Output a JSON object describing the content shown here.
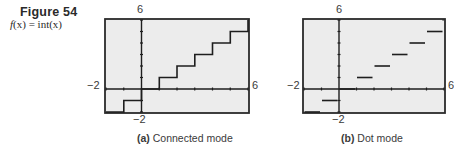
{
  "figure": {
    "label": "Figure 54",
    "function": "f(x) = int(x)",
    "function_prefix": "f",
    "function_rest": "(x)  =  int(x)"
  },
  "panels": [
    {
      "id": "a",
      "caption_tag": "(a)",
      "caption_text": "Connected mode",
      "ymax_label": "6",
      "ymin_label": "−2",
      "xmin_label": "−2",
      "xmax_label": "6"
    },
    {
      "id": "b",
      "caption_tag": "(b)",
      "caption_text": "Dot mode",
      "ymax_label": "6",
      "ymin_label": "−2",
      "xmin_label": "−2",
      "xmax_label": "6"
    }
  ],
  "colors": {
    "screen_bg": "#ececec",
    "frame": "#2b2b2b",
    "curve": "#1e1e1e"
  },
  "chart_data": [
    {
      "type": "line",
      "title": "(a) Connected mode",
      "function": "int(x)",
      "xlim": [
        -2,
        6
      ],
      "ylim": [
        -2,
        6
      ],
      "xscale": 1,
      "yscale": 1,
      "grid": false,
      "mode": "connected",
      "x": [
        -2,
        -1,
        -1,
        0,
        0,
        1,
        1,
        2,
        2,
        3,
        3,
        4,
        4,
        5,
        5,
        6,
        6
      ],
      "y": [
        -2,
        -2,
        -1,
        -1,
        0,
        0,
        1,
        1,
        2,
        2,
        3,
        3,
        4,
        4,
        5,
        5,
        6
      ]
    },
    {
      "type": "line",
      "title": "(b) Dot mode",
      "function": "int(x)",
      "xlim": [
        -2,
        6
      ],
      "ylim": [
        -2,
        6
      ],
      "xscale": 1,
      "yscale": 1,
      "grid": false,
      "mode": "dot",
      "segments": [
        {
          "x": [
            -2,
            -1
          ],
          "y": -2
        },
        {
          "x": [
            -1,
            0
          ],
          "y": -1
        },
        {
          "x": [
            0,
            1
          ],
          "y": 0
        },
        {
          "x": [
            1,
            2
          ],
          "y": 1
        },
        {
          "x": [
            2,
            3
          ],
          "y": 2
        },
        {
          "x": [
            3,
            4
          ],
          "y": 3
        },
        {
          "x": [
            4,
            5
          ],
          "y": 4
        },
        {
          "x": [
            5,
            6
          ],
          "y": 5
        },
        {
          "x": [
            6,
            6
          ],
          "y": 6
        }
      ]
    }
  ]
}
